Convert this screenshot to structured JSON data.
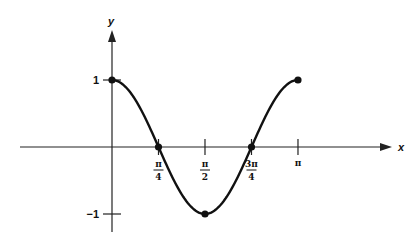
{
  "chart_data": {
    "type": "line",
    "title": "",
    "function": "y = cos(2x)",
    "xlabel": "x",
    "ylabel": "y",
    "xlim": [
      0,
      3.14159
    ],
    "ylim": [
      -1,
      1
    ],
    "x_ticks": [
      {
        "value": 0.7854,
        "num": "π",
        "den": "4"
      },
      {
        "value": 1.5708,
        "num": "π",
        "den": "2"
      },
      {
        "value": 2.3562,
        "num": "3π",
        "den": "4"
      },
      {
        "value": 3.14159,
        "num": "π",
        "den": ""
      }
    ],
    "y_ticks": [
      {
        "value": 1,
        "label": "1"
      },
      {
        "value": -1,
        "label": "−1"
      }
    ],
    "marked_points": [
      {
        "x": 0,
        "y": 1
      },
      {
        "x": 0.7854,
        "y": 0
      },
      {
        "x": 1.5708,
        "y": -1
      },
      {
        "x": 2.3562,
        "y": 0
      },
      {
        "x": 3.14159,
        "y": 1
      }
    ],
    "grid": false,
    "legend": null
  },
  "layout": {
    "origin_px": [
      112,
      147
    ],
    "x_scale_px_per_unit": 59.2,
    "y_scale_px_per_unit": 67
  }
}
